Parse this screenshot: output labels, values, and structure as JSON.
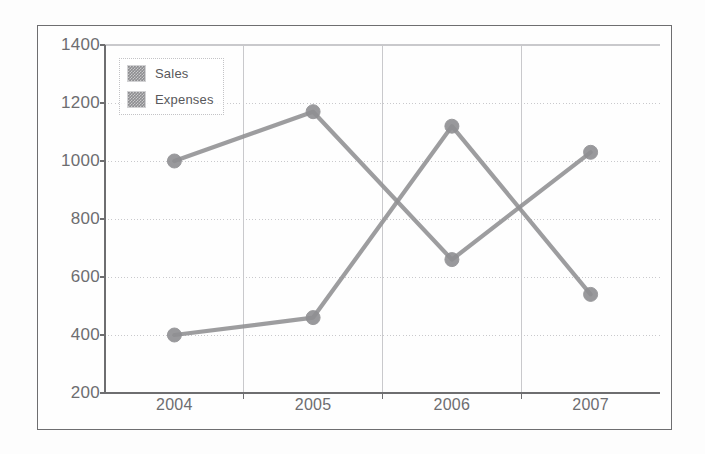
{
  "chart_data": {
    "type": "line",
    "title": "",
    "subtitle": "",
    "xlabel": "",
    "ylabel": "",
    "categories": [
      "2004",
      "2005",
      "2006",
      "2007"
    ],
    "series": [
      {
        "name": "Sales",
        "values": [
          1000,
          1170,
          660,
          1030
        ]
      },
      {
        "name": "Expenses",
        "values": [
          400,
          460,
          1120,
          540
        ]
      }
    ],
    "ylim": [
      200,
      1400
    ],
    "yticks": [
      200,
      400,
      600,
      800,
      1000,
      1200,
      1400
    ],
    "ytick_labels": [
      "200",
      "400",
      "600",
      "800",
      "1000",
      "1200",
      "1400"
    ],
    "grid": {
      "horizontal": true,
      "vertical": true,
      "horizontal_style": "dotted",
      "vertical_style": "solid"
    },
    "legend": {
      "position": "top-left",
      "entries": [
        "Sales",
        "Expenses"
      ]
    },
    "colors": {
      "sales_line": "#8f8f92",
      "expenses_line": "#8f8f92",
      "grid": "#c9c9cc",
      "axis": "#6e6e70",
      "tick_text": "#6d6d70",
      "frame": "#6e6e70",
      "legend_swatch": "#8d8d90"
    },
    "markers": {
      "shape": "circle",
      "radius": 7
    }
  },
  "figure": {
    "frame_visible": true,
    "background": "#fefefe"
  }
}
